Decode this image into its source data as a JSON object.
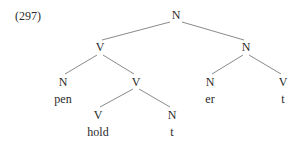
{
  "example_number": "(297)",
  "tree": {
    "nodes": [
      {
        "id": "root",
        "label": "N",
        "x": 176,
        "y": 15
      },
      {
        "id": "v1",
        "label": "V",
        "x": 100,
        "y": 47
      },
      {
        "id": "n1",
        "label": "N",
        "x": 246,
        "y": 47
      },
      {
        "id": "n2",
        "label": "N",
        "x": 63,
        "y": 82
      },
      {
        "id": "v2",
        "label": "V",
        "x": 136,
        "y": 82
      },
      {
        "id": "n3",
        "label": "N",
        "x": 210,
        "y": 82
      },
      {
        "id": "v3",
        "label": "V",
        "x": 283,
        "y": 82
      },
      {
        "id": "v4",
        "label": "V",
        "x": 98,
        "y": 115
      },
      {
        "id": "n4",
        "label": "N",
        "x": 172,
        "y": 115
      }
    ],
    "words": [
      {
        "label": "pen",
        "x": 63,
        "y": 99
      },
      {
        "label": "er",
        "x": 210,
        "y": 99
      },
      {
        "label": "t",
        "x": 283,
        "y": 99
      },
      {
        "label": "hold",
        "x": 98,
        "y": 132
      },
      {
        "label": "t",
        "x": 172,
        "y": 132
      }
    ],
    "edges": [
      {
        "x1": 170,
        "y1": 22,
        "x2": 102,
        "y2": 40
      },
      {
        "x1": 182,
        "y1": 22,
        "x2": 244,
        "y2": 40
      },
      {
        "x1": 97,
        "y1": 55,
        "x2": 65,
        "y2": 74
      },
      {
        "x1": 103,
        "y1": 55,
        "x2": 134,
        "y2": 74
      },
      {
        "x1": 243,
        "y1": 55,
        "x2": 212,
        "y2": 74
      },
      {
        "x1": 249,
        "y1": 55,
        "x2": 281,
        "y2": 74
      },
      {
        "x1": 133,
        "y1": 89,
        "x2": 100,
        "y2": 107
      },
      {
        "x1": 139,
        "y1": 89,
        "x2": 170,
        "y2": 107
      }
    ],
    "line_color": "#8a8a8a"
  }
}
